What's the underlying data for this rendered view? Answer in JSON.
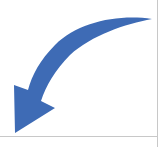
{
  "graphic": {
    "name": "curved-arrow",
    "direction": "down-left",
    "fill_color": "#3e6bb5"
  },
  "frame": {
    "line_color": "#c8c8c8"
  }
}
